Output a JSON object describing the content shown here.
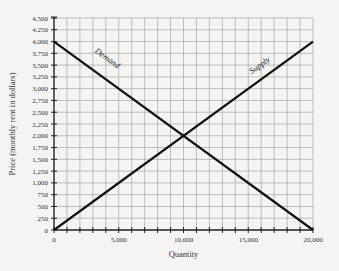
{
  "chart_data": {
    "type": "line",
    "title": "",
    "xlabel": "Quantity",
    "ylabel": "Price (monthly rent in dollars)",
    "xlim": [
      0,
      20000
    ],
    "ylim": [
      0,
      4500
    ],
    "x_gridlines_every": 1000,
    "y_gridlines_every": 250,
    "grid": true,
    "x_ticks": [
      {
        "value": 0,
        "label": "0"
      },
      {
        "value": 5000,
        "label": "5,000"
      },
      {
        "value": 10000,
        "label": "10,000"
      },
      {
        "value": 15000,
        "label": "15,000"
      },
      {
        "value": 20000,
        "label": "20,000"
      }
    ],
    "y_ticks": [
      {
        "value": 0,
        "label": "0"
      },
      {
        "value": 250,
        "label": "250"
      },
      {
        "value": 500,
        "label": "500"
      },
      {
        "value": 750,
        "label": "750"
      },
      {
        "value": 1000,
        "label": "1,000"
      },
      {
        "value": 1250,
        "label": "1,250"
      },
      {
        "value": 1500,
        "label": "1,500"
      },
      {
        "value": 1750,
        "label": "1,750"
      },
      {
        "value": 2000,
        "label": "2,000"
      },
      {
        "value": 2250,
        "label": "2,250"
      },
      {
        "value": 2500,
        "label": "2,500"
      },
      {
        "value": 2750,
        "label": "2,750"
      },
      {
        "value": 3000,
        "label": "3,000"
      },
      {
        "value": 3250,
        "label": "3,250"
      },
      {
        "value": 3500,
        "label": "3,500"
      },
      {
        "value": 3750,
        "label": "3,750"
      },
      {
        "value": 4000,
        "label": "4,000"
      },
      {
        "value": 4250,
        "label": "4,250"
      },
      {
        "value": 4500,
        "label": "4,500"
      }
    ],
    "series": [
      {
        "name": "Demand",
        "label": "Demand",
        "points": [
          [
            0,
            4000
          ],
          [
            20000,
            0
          ]
        ],
        "label_at": [
          4000,
          3600
        ]
      },
      {
        "name": "Supply",
        "label": "Supply",
        "points": [
          [
            0,
            0
          ],
          [
            20000,
            4000
          ]
        ],
        "label_at": [
          16000,
          3450
        ]
      }
    ],
    "equilibrium": {
      "x": 10000,
      "y": 2000
    }
  }
}
